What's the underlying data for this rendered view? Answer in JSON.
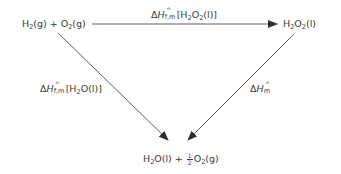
{
  "diagram": {
    "type": "thermochemical-cycle",
    "nodes": {
      "reactants": {
        "base": "H",
        "parts": [
          "H",
          "2",
          "(g) + O",
          "2",
          "(g)"
        ],
        "text": "H2(g) + O2(g)"
      },
      "intermediate": {
        "parts": [
          "H",
          "2",
          "O",
          "2",
          "(l)"
        ],
        "text": "H2O2(l)"
      },
      "products": {
        "parts": [
          "H",
          "2",
          "O(l) + ",
          "1",
          "2",
          "O",
          "2",
          "(g)"
        ],
        "text": "H2O(l) + 1/2 O2(g)"
      }
    },
    "edges": {
      "top": {
        "from": "reactants",
        "to": "intermediate",
        "delta": "Δ",
        "symbol": "H",
        "sub": "f,m",
        "sup": "⦵",
        "species": "[H",
        "species_sub1": "2",
        "species_mid": "O",
        "species_sub2": "2",
        "species_end": "(l)]",
        "text": "ΔHf,m⦵[H2O2(l)]"
      },
      "left": {
        "from": "reactants",
        "to": "products",
        "delta": "Δ",
        "symbol": "H",
        "sub": "f,m",
        "sup": "⦵",
        "species": "[H",
        "species_sub1": "2",
        "species_end": "O(l)]",
        "text": "ΔHf,m⦵[H2O(l)]"
      },
      "right": {
        "from": "intermediate",
        "to": "products",
        "delta": "Δ",
        "symbol": "H",
        "sub": "m",
        "sup": "⦵",
        "text": "ΔHm⦵"
      }
    },
    "colors": {
      "line": "#4a4a4a",
      "text": "#3a3a3a",
      "background": "#ffffff"
    }
  }
}
